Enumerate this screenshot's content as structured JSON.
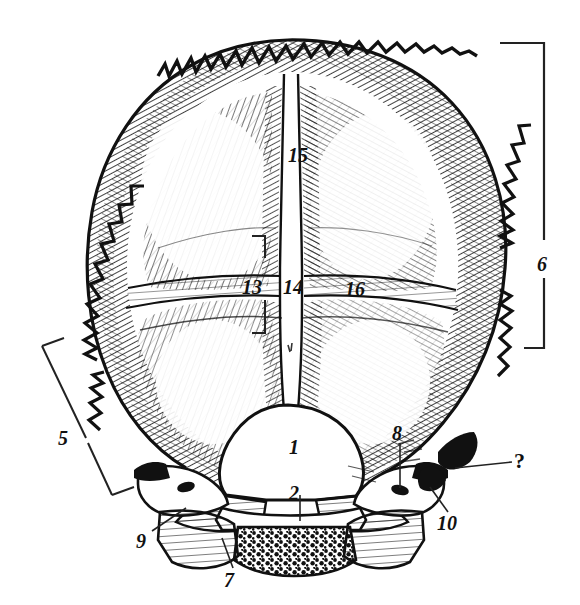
{
  "figure": {
    "kind": "anatomical-engraving",
    "background_color": "#ffffff",
    "ink_color": "#111111"
  },
  "labels": [
    {
      "id": "label-1",
      "text": "1",
      "x": 289,
      "y": 437,
      "kind": "number",
      "leader": false
    },
    {
      "id": "label-2",
      "text": "2",
      "x": 289,
      "y": 483,
      "kind": "number",
      "leader": true
    },
    {
      "id": "label-5",
      "text": "5",
      "x": 58,
      "y": 428,
      "kind": "number",
      "leader": false
    },
    {
      "id": "label-6",
      "text": "6",
      "x": 537,
      "y": 254,
      "kind": "number",
      "leader": false
    },
    {
      "id": "label-7",
      "text": "7",
      "x": 224,
      "y": 570,
      "kind": "number",
      "leader": true
    },
    {
      "id": "label-8",
      "text": "8",
      "x": 392,
      "y": 423,
      "kind": "number",
      "leader": true
    },
    {
      "id": "label-9",
      "text": "9",
      "x": 136,
      "y": 531,
      "kind": "number",
      "leader": true
    },
    {
      "id": "label-10",
      "text": "10",
      "x": 437,
      "y": 513,
      "kind": "number",
      "leader": true
    },
    {
      "id": "label-13",
      "text": "13",
      "x": 242,
      "y": 277,
      "kind": "number",
      "leader": false
    },
    {
      "id": "label-14",
      "text": "14",
      "x": 283,
      "y": 277,
      "kind": "number",
      "leader": false
    },
    {
      "id": "label-15",
      "text": "15",
      "x": 288,
      "y": 145,
      "kind": "number",
      "leader": false
    },
    {
      "id": "label-16",
      "text": "16",
      "x": 345,
      "y": 279,
      "kind": "number",
      "leader": false
    },
    {
      "id": "label-question",
      "text": "?",
      "x": 514,
      "y": 450,
      "kind": "query",
      "leader": true
    }
  ],
  "brackets": [
    {
      "id": "bracket-6",
      "for": "6",
      "orientation": "vertical-right",
      "x": 544,
      "y_top": 43,
      "y_bottom": 348,
      "arm_top_x": 500,
      "arm_bottom_x": 524
    },
    {
      "id": "bracket-5",
      "for": "5",
      "orientation": "slanted-left",
      "x1": 42,
      "y1": 346,
      "x2": 112,
      "y2": 495
    },
    {
      "id": "bracket-13",
      "for": "13",
      "orientation": "vertical-small",
      "x": 265,
      "y_top": 236,
      "y_bottom": 333,
      "arm_x": 252
    }
  ],
  "leaders": [
    {
      "id": "leader-2",
      "from_x": 300,
      "from_y": 495,
      "to_x": 300,
      "to_y": 521
    },
    {
      "id": "leader-7",
      "from_x": 233,
      "from_y": 568,
      "to_x": 222,
      "to_y": 538
    },
    {
      "id": "leader-8",
      "from_x": 400,
      "from_y": 443,
      "to_x": 400,
      "to_y": 488
    },
    {
      "id": "leader-9",
      "from_x": 152,
      "from_y": 531,
      "to_x": 186,
      "to_y": 508
    },
    {
      "id": "leader-10",
      "from_x": 448,
      "from_y": 512,
      "to_x": 430,
      "to_y": 487
    },
    {
      "id": "leader-question",
      "from_x": 512,
      "from_y": 462,
      "to_x": 455,
      "to_y": 468
    }
  ]
}
